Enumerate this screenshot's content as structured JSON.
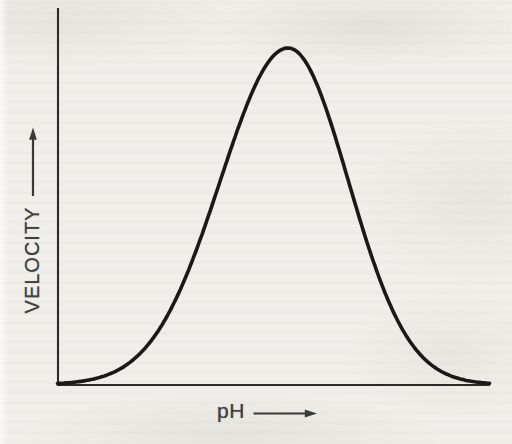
{
  "page": {
    "background_color": "#f1efeb",
    "ink_color": "#262626",
    "label_color": "#414141",
    "kind": "scanned textbook figure"
  },
  "chart_data": {
    "type": "line",
    "title": "",
    "xlabel": "pH",
    "ylabel": "VELOCITY",
    "x_axis": {
      "label": "pH",
      "tick_labels": [],
      "arrow": "right",
      "range_shown": "unlabeled qualitative axis"
    },
    "y_axis": {
      "label": "VELOCITY",
      "tick_labels": [],
      "arrow": "up",
      "range_shown": "unlabeled qualitative axis"
    },
    "grid": false,
    "legend": "none",
    "series": [
      {
        "name": "velocity-vs-pH",
        "model": {
          "type": "asymmetric_gaussian",
          "peak_t": 0.534,
          "sigma_left": 0.157,
          "sigma_right": 0.139,
          "amplitude": 1.0
        },
        "points": [
          [
            0.0,
            0.003
          ],
          [
            0.05,
            0.009
          ],
          [
            0.1,
            0.022
          ],
          [
            0.15,
            0.05
          ],
          [
            0.2,
            0.104
          ],
          [
            0.25,
            0.195
          ],
          [
            0.3,
            0.329
          ],
          [
            0.35,
            0.503
          ],
          [
            0.4,
            0.695
          ],
          [
            0.45,
            0.867
          ],
          [
            0.5,
            0.977
          ],
          [
            0.534,
            1.0
          ],
          [
            0.55,
            0.993
          ],
          [
            0.6,
            0.893
          ],
          [
            0.65,
            0.706
          ],
          [
            0.7,
            0.49
          ],
          [
            0.75,
            0.299
          ],
          [
            0.8,
            0.16
          ],
          [
            0.85,
            0.076
          ],
          [
            0.9,
            0.031
          ],
          [
            0.95,
            0.011
          ],
          [
            1.0,
            0.004
          ]
        ]
      }
    ]
  }
}
